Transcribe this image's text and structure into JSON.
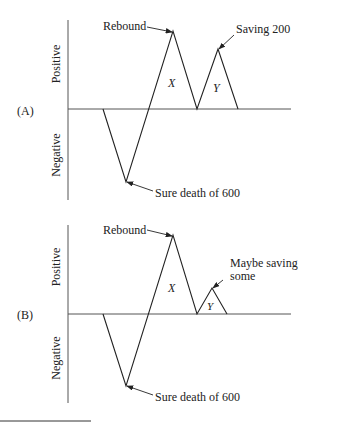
{
  "panels": [
    {
      "label": "(A)",
      "axis_positive": "Positive",
      "axis_negative": "Negative",
      "annotations": {
        "rebound": "Rebound",
        "saving": "Saving 200",
        "death": "Sure death of 600",
        "area_x": "X",
        "area_y": "Y"
      }
    },
    {
      "label": "(B)",
      "axis_positive": "Positive",
      "axis_negative": "Negative",
      "annotations": {
        "rebound": "Rebound",
        "saving_line1": "Maybe saving",
        "saving_line2": "some",
        "death": "Sure death of 600",
        "area_x": "X",
        "area_y": "Y"
      }
    }
  ],
  "colors": {
    "line": "#222222",
    "axis": "#555555"
  }
}
